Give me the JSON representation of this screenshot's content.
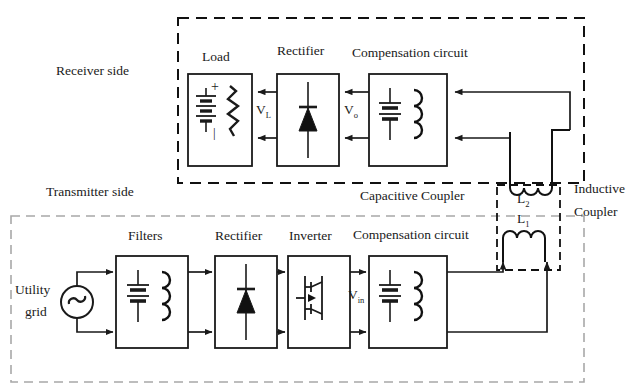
{
  "diagram": {
    "colors": {
      "line": "#1a1a1a",
      "dashed_receiver": "#111111",
      "dashed_transmitter": "#9a9a9a",
      "dashed_inductive": "#111111",
      "background": "#ffffff"
    }
  },
  "regions": {
    "receiver_side": {
      "label": "Receiver side"
    },
    "transmitter_side": {
      "label": "Transmitter side"
    },
    "capacitive_coupler": {
      "label": "Capacitive Coupler"
    },
    "inductive_coupler": {
      "label_line1": "Inductive",
      "label_line2": "Coupler"
    }
  },
  "receiver_blocks": [
    {
      "name": "load",
      "label": "Load",
      "symbols": [
        "battery",
        "resistor"
      ]
    },
    {
      "name": "rectifier",
      "label": "Rectifier",
      "symbols": [
        "diode"
      ]
    },
    {
      "name": "compensation",
      "label": "Compensation circuit",
      "symbols": [
        "capacitor",
        "inductor"
      ]
    }
  ],
  "transmitter_blocks": [
    {
      "name": "filters",
      "label": "Filters",
      "symbols": [
        "capacitor",
        "inductor"
      ]
    },
    {
      "name": "rectifier",
      "label": "Rectifier",
      "symbols": [
        "diode"
      ]
    },
    {
      "name": "inverter",
      "label": "Inverter",
      "symbols": [
        "igbt"
      ]
    },
    {
      "name": "compensation",
      "label": "Compensation circuit",
      "symbols": [
        "capacitor",
        "inductor"
      ]
    }
  ],
  "source": {
    "label_line1": "Utility",
    "label_line2": "grid",
    "symbol": "ac-source"
  },
  "voltages": [
    {
      "name": "load-voltage",
      "base": "V",
      "sub": "L"
    },
    {
      "name": "output-voltage",
      "base": "V",
      "sub": "o"
    },
    {
      "name": "inverter-voltage",
      "base": "V",
      "sub": "in"
    }
  ],
  "coils": [
    {
      "name": "receiver-coil",
      "base": "L",
      "sub": "2"
    },
    {
      "name": "transmitter-coil",
      "base": "L",
      "sub": "1"
    }
  ],
  "polarity": {
    "plus": "+",
    "minus": "|"
  }
}
